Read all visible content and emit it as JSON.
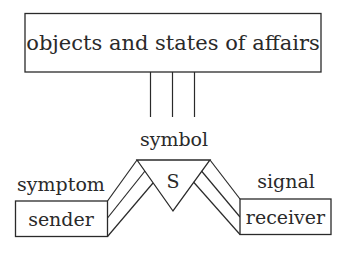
{
  "diagram": {
    "top_box": {
      "label": "objects and states of affairs"
    },
    "symbol": {
      "label": "symbol",
      "letter": "S"
    },
    "sender": {
      "label": "sender",
      "function": "symptom"
    },
    "receiver": {
      "label": "receiver",
      "function": "signal"
    },
    "connectors": {
      "top_lines": 3,
      "left_lines": 3,
      "right_lines": 3
    },
    "colors": {
      "stroke": "#2a2a2a",
      "background": "#ffffff"
    }
  }
}
